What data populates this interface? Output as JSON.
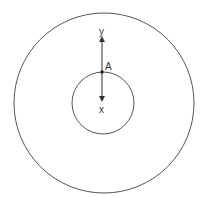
{
  "diagram": {
    "outer_circle": {
      "cx": 104,
      "cy": 103,
      "r": 90
    },
    "inner_circle": {
      "cx": 103,
      "cy": 103,
      "r": 31
    },
    "point": {
      "label": "A",
      "x": 102,
      "y": 72
    },
    "axes": {
      "y": {
        "label": "y",
        "direction": "up"
      },
      "x": {
        "label": "x",
        "direction": "down"
      }
    },
    "colors": {
      "stroke": "#444444",
      "text": "#333333"
    }
  }
}
